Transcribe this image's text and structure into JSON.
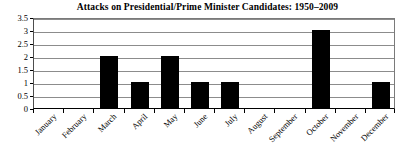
{
  "chart_data": {
    "type": "bar",
    "title": "Attacks on Presidential/Prime Minister Candidates: 1950–2009",
    "xlabel": "",
    "ylabel": "",
    "categories": [
      "January",
      "February",
      "March",
      "April",
      "May",
      "June",
      "July",
      "August",
      "September",
      "October",
      "November",
      "December"
    ],
    "values": [
      0,
      0,
      2,
      1,
      2,
      1,
      1,
      0,
      0,
      3,
      0,
      1
    ],
    "ylim": [
      0,
      3.5
    ],
    "ytick_labels": [
      "0",
      "0.5",
      "1",
      "1.5",
      "2",
      "2.5",
      "3",
      "3.5"
    ],
    "ytick_values": [
      0,
      0.5,
      1,
      1.5,
      2,
      2.5,
      3,
      3.5
    ],
    "grid": true,
    "legend": false,
    "bar_color": "#000000",
    "grid_color": "#8c8c8c",
    "background_color": "#ffffff",
    "xtick_label_rotation": -45
  }
}
